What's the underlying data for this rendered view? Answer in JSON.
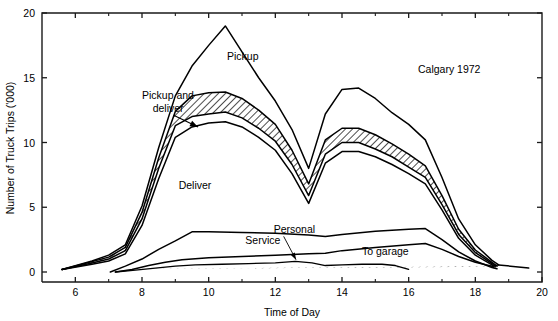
{
  "chart_data": {
    "type": "line",
    "title": "",
    "annotation": "Calgary 1972",
    "xlabel": "Time of Day",
    "ylabel": "Number of Truck Trips ('000)",
    "xlim": [
      5,
      20
    ],
    "ylim": [
      0,
      20
    ],
    "xticks": [
      6,
      8,
      10,
      12,
      14,
      16,
      18,
      20
    ],
    "xticklabels": [
      "6",
      "8",
      "10",
      "12",
      "14",
      "16",
      "18",
      "20"
    ],
    "xminorticks": [
      7,
      9,
      11,
      13,
      15,
      17,
      19
    ],
    "yticks": [
      0,
      5,
      10,
      15,
      20
    ],
    "yticklabels": [
      "0",
      "5",
      "10",
      "15",
      "20"
    ],
    "grid": false,
    "legend_position": "inline-labels",
    "series": [
      {
        "name": "Pickup",
        "label": "Pickup",
        "label_x": 10.55,
        "label_y": 16.4,
        "x": [
          5.6,
          6.5,
          7.0,
          7.5,
          8.0,
          8.5,
          9.0,
          9.5,
          10.0,
          10.5,
          11.0,
          11.5,
          12.0,
          12.5,
          13.0,
          13.5,
          14.0,
          14.5,
          15.0,
          15.5,
          16.0,
          16.5,
          17.0,
          17.5,
          18.0,
          18.5,
          18.7
        ],
        "values": [
          0.2,
          0.85,
          1.3,
          2.1,
          5.1,
          9.6,
          13.6,
          15.9,
          17.5,
          19.0,
          17.0,
          15.0,
          13.2,
          11.0,
          8.0,
          12.2,
          14.1,
          14.2,
          13.4,
          12.3,
          11.4,
          10.2,
          7.3,
          4.1,
          2.1,
          0.9,
          0.55
        ]
      },
      {
        "name": "Pickup and deliver upper",
        "label": "Pickup and deliver",
        "label_x": 8.1,
        "label_y": 13.2,
        "x": [
          5.6,
          6.5,
          7.0,
          7.5,
          8.0,
          8.5,
          9.0,
          9.5,
          10.0,
          10.5,
          11.0,
          11.5,
          12.0,
          12.5,
          13.0,
          13.5,
          14.0,
          14.5,
          15.0,
          15.5,
          16.0,
          16.5,
          17.0,
          17.5,
          18.0,
          18.5,
          18.65
        ],
        "values": [
          0.2,
          0.8,
          1.15,
          1.9,
          4.6,
          8.8,
          12.4,
          13.6,
          13.85,
          13.9,
          13.4,
          12.5,
          11.4,
          9.4,
          6.8,
          10.2,
          11.1,
          11.1,
          10.6,
          9.9,
          9.1,
          8.2,
          5.9,
          3.3,
          1.7,
          0.75,
          0.45
        ]
      },
      {
        "name": "Pickup and deliver lower",
        "x": [
          5.6,
          6.5,
          7.0,
          7.5,
          8.0,
          8.5,
          9.0,
          9.5,
          10.0,
          10.5,
          11.0,
          11.5,
          12.0,
          12.5,
          13.0,
          13.5,
          14.0,
          14.5,
          15.0,
          15.5,
          16.0,
          16.5,
          17.0,
          17.5,
          18.0,
          18.5,
          18.6
        ],
        "values": [
          0.2,
          0.7,
          1.0,
          1.65,
          4.1,
          8.0,
          11.3,
          12.0,
          12.2,
          12.35,
          11.9,
          11.1,
          10.1,
          8.3,
          5.9,
          9.1,
          10.0,
          10.0,
          9.5,
          8.9,
          8.1,
          7.3,
          5.2,
          2.9,
          1.5,
          0.65,
          0.4
        ]
      },
      {
        "name": "Deliver",
        "label": "Deliver",
        "label_x": 9.1,
        "label_y": 6.4,
        "x": [
          5.6,
          6.5,
          7.0,
          7.5,
          8.0,
          8.5,
          9.0,
          9.5,
          10.0,
          10.5,
          11.0,
          11.5,
          12.0,
          12.5,
          13.0,
          13.5,
          14.0,
          14.5,
          15.0,
          15.5,
          16.0,
          16.5,
          17.0,
          17.5,
          18.0,
          18.5,
          18.55
        ],
        "values": [
          0.2,
          0.6,
          0.85,
          1.4,
          3.6,
          7.2,
          10.4,
          11.2,
          11.5,
          11.6,
          11.2,
          10.4,
          9.4,
          7.6,
          5.3,
          8.4,
          9.3,
          9.3,
          8.9,
          8.3,
          7.6,
          6.8,
          4.8,
          2.6,
          1.3,
          0.55,
          0.35
        ]
      },
      {
        "name": "Service",
        "label": "Service",
        "label_x": 11.1,
        "label_y": 2.15,
        "x": [
          7.05,
          7.5,
          8.0,
          8.5,
          9.0,
          9.5,
          10.0,
          11.0,
          12.0,
          13.0,
          13.5,
          14.0,
          15.0,
          16.0,
          16.5,
          17.0,
          17.5,
          18.0,
          18.5,
          18.65
        ],
        "values": [
          0.0,
          0.45,
          1.0,
          1.75,
          2.4,
          3.1,
          3.1,
          3.05,
          3.0,
          2.85,
          2.75,
          2.9,
          3.15,
          3.3,
          3.35,
          2.5,
          1.55,
          0.85,
          0.35,
          0.25
        ]
      },
      {
        "name": "To garage",
        "label": "To garage",
        "label_x": 14.6,
        "label_y": 1.35,
        "x": [
          7.2,
          7.7,
          8.2,
          8.7,
          9.2,
          10.0,
          11.0,
          12.0,
          13.0,
          13.5,
          14.0,
          15.0,
          16.0,
          16.5,
          17.0,
          17.5,
          18.0,
          18.5,
          18.7,
          19.6
        ],
        "values": [
          0.0,
          0.2,
          0.5,
          0.75,
          0.95,
          1.1,
          1.2,
          1.3,
          1.4,
          1.45,
          1.65,
          1.9,
          2.1,
          2.2,
          1.75,
          1.2,
          0.75,
          0.45,
          0.55,
          0.3
        ]
      },
      {
        "name": "Personal",
        "label": "Personal",
        "label_x": 11.95,
        "label_y": 3.05,
        "x": [
          7.2,
          7.8,
          8.4,
          9.0,
          9.6,
          10.4,
          11.2,
          12.0,
          12.6,
          13.1,
          13.5,
          14.0,
          14.6,
          15.2,
          15.6,
          16.0
        ],
        "values": [
          0.0,
          0.15,
          0.3,
          0.45,
          0.55,
          0.6,
          0.65,
          0.7,
          0.82,
          0.7,
          0.5,
          0.55,
          0.6,
          0.6,
          0.5,
          0.2
        ]
      }
    ],
    "annotations": [
      {
        "text": "Pickup and",
        "x": 8.0,
        "y": 13.35
      },
      {
        "text": "deliver",
        "x": 8.32,
        "y": 12.35
      }
    ]
  }
}
